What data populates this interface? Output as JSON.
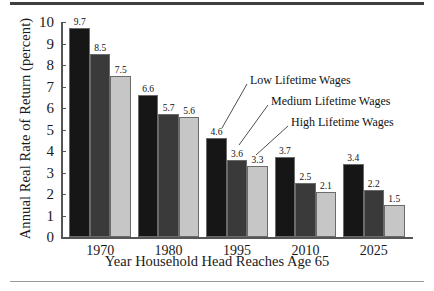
{
  "chart_data": {
    "type": "bar",
    "title": "",
    "subtitle": "",
    "xlabel": "Year Household Head Reaches Age 65",
    "ylabel": "Annual Real Rate of Return (percent)",
    "categories": [
      "1970",
      "1980",
      "1995",
      "2010",
      "2025"
    ],
    "series": [
      {
        "name": "Low Lifetime Wages",
        "color": "#161616",
        "values": [
          9.7,
          6.6,
          4.6,
          3.7,
          3.4
        ]
      },
      {
        "name": "Medium Lifetime Wages",
        "color": "#3a3a3a",
        "values": [
          8.5,
          5.7,
          3.6,
          2.5,
          2.2
        ]
      },
      {
        "name": "High Lifetime Wages",
        "color": "#c6c6c6",
        "values": [
          7.5,
          5.6,
          3.3,
          2.1,
          1.5
        ]
      }
    ],
    "ylim": [
      0,
      10
    ],
    "yticks": [
      "0",
      "1",
      "2",
      "3",
      "4",
      "5",
      "6",
      "7",
      "8",
      "9",
      "10"
    ],
    "grid": false,
    "legend_position": "inline-callouts",
    "annotations": [
      {
        "text": "Low Lifetime Wages",
        "points_to": "1995 first bar"
      },
      {
        "text": "Medium Lifetime Wages",
        "points_to": "1995 second bar"
      },
      {
        "text": "High Lifetime Wages",
        "points_to": "1995 third bar"
      }
    ]
  }
}
